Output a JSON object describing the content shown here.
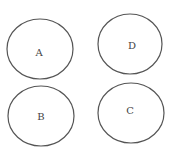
{
  "diagram": {
    "type": "four-circles",
    "stroke_color": "#555555",
    "label_color": "#444444",
    "nodes": [
      {
        "id": "A",
        "label": "A",
        "cx": 40,
        "cy": 49,
        "rx": 33,
        "ry": 30,
        "lx": 39,
        "ly": 52
      },
      {
        "id": "D",
        "label": "D",
        "cx": 130,
        "cy": 44,
        "rx": 32,
        "ry": 30,
        "lx": 132,
        "ly": 45
      },
      {
        "id": "B",
        "label": "B",
        "cx": 41,
        "cy": 116,
        "rx": 33,
        "ry": 30,
        "lx": 41,
        "ly": 116
      },
      {
        "id": "C",
        "label": "C",
        "cx": 131,
        "cy": 113,
        "rx": 33,
        "ry": 30,
        "lx": 130,
        "ly": 110
      }
    ]
  }
}
